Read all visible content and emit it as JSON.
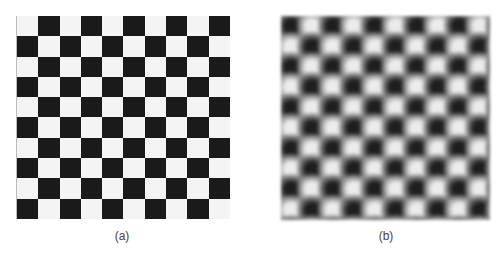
{
  "figure": {
    "panels": [
      {
        "id": "a",
        "caption": "(a)",
        "description": "Binary checkerboard pattern",
        "grid": {
          "rows": 10,
          "cols": 10,
          "top_left": "white"
        },
        "colors": {
          "light": "#f4f4f4",
          "dark": "#1a1a1a"
        }
      },
      {
        "id": "b",
        "caption": "(b)",
        "description": "Blurred (low-pass filtered) checkerboard",
        "grid": {
          "rows": 10,
          "cols": 10,
          "top_left": "dark"
        },
        "colors": {
          "light": "#ececec",
          "dark": "#1e1e1e",
          "background": "#8a8a8a"
        }
      }
    ]
  }
}
